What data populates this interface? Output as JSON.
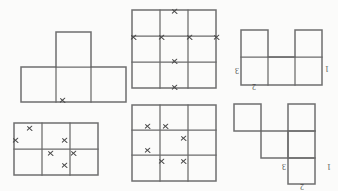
{
  "page": {
    "orientation": "scanned upside-down",
    "background_color": "#fdfdfc",
    "line_color": "#6b6b6b",
    "mark_color": "#4a4a4a",
    "label_color": "#4d4d4d"
  },
  "figures": [
    {
      "id": "fig-1",
      "name": "t-tetromino",
      "position": "top-left",
      "shape": "T-shaped polyomino: three unit squares in a horizontal row with one unit square above the middle square",
      "cell_size": 35,
      "columns": 3,
      "rows": 2,
      "marks": [
        {
          "label": "x",
          "edge": "bottom",
          "x": 62,
          "y": 69
        }
      ],
      "labels": []
    },
    {
      "id": "fig-2",
      "name": "three-by-three-grid-top",
      "position": "top-middle",
      "shape": "3 by 3 square grid",
      "cell_size": 28,
      "columns": 3,
      "rows": 3,
      "marks": [
        {
          "label": "x",
          "x": 173,
          "y": 11
        },
        {
          "label": "x",
          "x": 137,
          "y": 46
        },
        {
          "label": "x",
          "x": 164,
          "y": 46
        },
        {
          "label": "x",
          "x": 192,
          "y": 46
        },
        {
          "label": "x",
          "x": 215,
          "y": 46
        },
        {
          "label": "x",
          "x": 173,
          "y": 60
        },
        {
          "label": "x",
          "x": 173,
          "y": 81
        }
      ],
      "labels": []
    },
    {
      "id": "fig-3",
      "name": "u-pentomino",
      "position": "top-right",
      "shape": "U-shaped pentomino: three unit squares in a row with one square above the left end and one square above the right end",
      "cell_size": 27,
      "columns": 3,
      "rows": 2,
      "marks": [],
      "labels": [
        {
          "text": "3",
          "side": "left",
          "x": 237,
          "y": 70,
          "rotated": true
        },
        {
          "text": "2",
          "side": "bottom",
          "x": 254,
          "y": 86,
          "rotated": true
        },
        {
          "text": "1",
          "side": "right",
          "x": 327,
          "y": 68,
          "rotated": true
        }
      ]
    },
    {
      "id": "fig-4",
      "name": "three-by-two-grid",
      "position": "bottom-left",
      "shape": "3 columns by 2 rows rectangular grid",
      "cell_size": 28,
      "columns": 3,
      "rows": 2,
      "marks": [
        {
          "label": "x",
          "x": 29,
          "y": 128
        },
        {
          "label": "x",
          "x": 15,
          "y": 140
        },
        {
          "label": "x",
          "x": 64,
          "y": 140
        },
        {
          "label": "x",
          "x": 50,
          "y": 153
        },
        {
          "label": "x",
          "x": 73,
          "y": 153
        },
        {
          "label": "x",
          "x": 64,
          "y": 165
        }
      ],
      "labels": []
    },
    {
      "id": "fig-5",
      "name": "three-by-three-grid-bottom",
      "position": "bottom-middle",
      "shape": "3 by 3 square grid",
      "cell_size": 28,
      "columns": 3,
      "rows": 3,
      "marks": [
        {
          "label": "x",
          "x": 147,
          "y": 126
        },
        {
          "label": "x",
          "x": 165,
          "y": 126
        },
        {
          "label": "x",
          "x": 183,
          "y": 138
        },
        {
          "label": "x",
          "x": 147,
          "y": 150
        },
        {
          "label": "x",
          "x": 161,
          "y": 161
        },
        {
          "label": "x",
          "x": 183,
          "y": 161
        }
      ],
      "labels": []
    },
    {
      "id": "fig-6",
      "name": "zigzag-polyomino",
      "position": "bottom-right",
      "shape": "Staircase polyomino: square at upper-left, square at upper-right, stepped connection down to a square at lower-right",
      "cell_size": 27,
      "columns": 3,
      "rows": 3,
      "marks": [],
      "labels": [
        {
          "text": "3",
          "side": "left",
          "x": 285,
          "y": 166,
          "rotated": true
        },
        {
          "text": "2",
          "side": "bottom",
          "x": 303,
          "y": 184,
          "rotated": true
        },
        {
          "text": "1",
          "side": "right",
          "x": 330,
          "y": 166,
          "rotated": true
        }
      ]
    }
  ]
}
